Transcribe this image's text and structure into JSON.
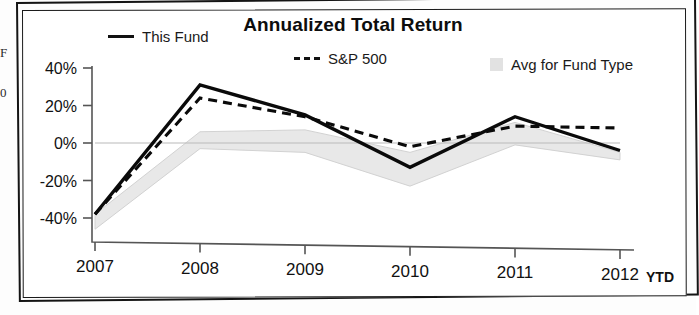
{
  "chart_data": {
    "type": "line",
    "title": "Annualized Total Return",
    "xlabel": "",
    "ylabel": "",
    "x": [
      "2007",
      "2008",
      "2009",
      "2010",
      "2011",
      "2012"
    ],
    "x_note": "YTD",
    "categories": [
      "2007",
      "2008",
      "2009",
      "2010",
      "2011",
      "2012"
    ],
    "ylim": [
      -40,
      40
    ],
    "yticks": [
      40,
      20,
      0,
      -20,
      -40
    ],
    "ytick_labels": [
      "40%",
      "20%",
      "0%",
      "-20%",
      "-40%"
    ],
    "grid": false,
    "legend_position": "top",
    "series": [
      {
        "name": "This Fund",
        "style": "solid",
        "color": "#0a0a0a",
        "values": [
          -38,
          31,
          15,
          -13,
          14,
          -4
        ]
      },
      {
        "name": "S&P 500",
        "style": "dashed",
        "color": "#0a0a0a",
        "values": [
          -38,
          24,
          14,
          -2,
          9,
          8
        ]
      },
      {
        "name": "Avg for Fund Type",
        "style": "band",
        "color": "#e2e2e2",
        "upper": [
          -38,
          6,
          7,
          -5,
          11,
          -5
        ],
        "lower": [
          -46,
          -3,
          -5,
          -23,
          -1,
          -9
        ]
      }
    ]
  },
  "chart": {
    "title": "Annualized Total Return",
    "legend": [
      {
        "label": "This Fund",
        "marker": "solid-line-swatch"
      },
      {
        "label": "S&P 500",
        "marker": "dashed-line-swatch"
      },
      {
        "label": "Avg for Fund Type",
        "marker": "gray-box-swatch"
      }
    ],
    "y_axis": {
      "labels": [
        "40%",
        "20%",
        "0%",
        "-20%",
        "-40%"
      ]
    },
    "x_axis": {
      "labels": [
        "2007",
        "2008",
        "2009",
        "2010",
        "2011",
        "2012"
      ],
      "suffix": "YTD"
    }
  },
  "scan_artifacts": {
    "left_edge_fragments": [
      "F",
      "0"
    ]
  }
}
